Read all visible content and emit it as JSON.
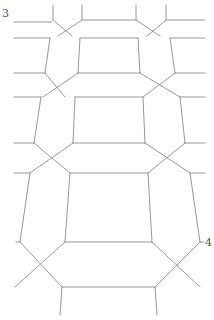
{
  "diagram": {
    "type": "line-drawing",
    "stroke_color": "#8a8a8a",
    "labels": [
      {
        "id": "label-3",
        "text": "3",
        "x": 2,
        "y": 8
      },
      {
        "id": "label-4",
        "text": "4",
        "x": 205,
        "y": 237
      }
    ],
    "segments": [
      [
        53,
        5,
        53,
        20
      ],
      [
        82,
        5,
        82,
        20
      ],
      [
        136,
        5,
        136,
        20
      ],
      [
        166,
        5,
        166,
        20
      ],
      [
        14,
        22,
        52,
        22
      ],
      [
        82,
        20,
        136,
        20
      ],
      [
        166,
        20,
        205,
        20
      ],
      [
        53,
        20,
        72,
        36
      ],
      [
        82,
        20,
        58,
        36
      ],
      [
        136,
        20,
        160,
        36
      ],
      [
        166,
        20,
        147,
        36
      ],
      [
        14,
        38,
        50,
        38
      ],
      [
        80,
        38,
        138,
        38
      ],
      [
        170,
        38,
        205,
        38
      ],
      [
        50,
        38,
        45,
        73
      ],
      [
        80,
        38,
        78,
        73
      ],
      [
        138,
        38,
        140,
        73
      ],
      [
        170,
        38,
        175,
        73
      ],
      [
        14,
        73,
        45,
        73
      ],
      [
        78,
        73,
        140,
        73
      ],
      [
        175,
        73,
        205,
        73
      ],
      [
        45,
        73,
        65,
        97
      ],
      [
        78,
        73,
        43,
        97
      ],
      [
        140,
        73,
        180,
        97
      ],
      [
        175,
        73,
        143,
        97
      ],
      [
        14,
        97,
        41,
        97
      ],
      [
        75,
        97,
        143,
        97
      ],
      [
        180,
        97,
        205,
        97
      ],
      [
        41,
        97,
        34,
        143
      ],
      [
        75,
        97,
        73,
        143
      ],
      [
        143,
        97,
        145,
        143
      ],
      [
        180,
        97,
        185,
        143
      ],
      [
        14,
        143,
        34,
        143
      ],
      [
        73,
        143,
        145,
        143
      ],
      [
        185,
        143,
        205,
        143
      ],
      [
        34,
        143,
        70,
        173
      ],
      [
        73,
        143,
        30,
        173
      ],
      [
        145,
        143,
        190,
        173
      ],
      [
        185,
        143,
        148,
        173
      ],
      [
        14,
        173,
        30,
        173
      ],
      [
        70,
        173,
        148,
        173
      ],
      [
        190,
        173,
        205,
        173
      ],
      [
        30,
        173,
        20,
        242
      ],
      [
        70,
        173,
        65,
        242
      ],
      [
        148,
        173,
        152,
        242
      ],
      [
        190,
        173,
        200,
        242
      ],
      [
        16,
        242,
        20,
        242
      ],
      [
        65,
        242,
        152,
        242
      ],
      [
        200,
        242,
        204,
        242
      ],
      [
        20,
        242,
        62,
        287
      ],
      [
        65,
        242,
        15,
        287
      ],
      [
        152,
        242,
        200,
        287
      ],
      [
        200,
        242,
        155,
        287
      ],
      [
        62,
        287,
        155,
        287
      ],
      [
        62,
        287,
        60,
        315
      ],
      [
        155,
        287,
        157,
        315
      ]
    ]
  }
}
